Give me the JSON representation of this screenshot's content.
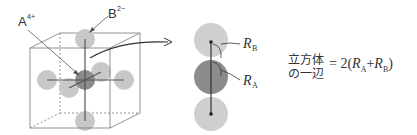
{
  "labels": {
    "cation": "A",
    "cation_charge": "4+",
    "anion": "B",
    "anion_charge": "2−",
    "radius_b": "R",
    "radius_b_sub": "B",
    "radius_a": "R",
    "radius_a_sub": "A"
  },
  "formula": {
    "line1": "立方体",
    "line2": "の一辺",
    "equals": "= 2(",
    "ra": "R",
    "ra_sub": "A",
    "plus": "+",
    "rb": "R",
    "rb_sub": "B",
    "close": ")"
  },
  "colors": {
    "anion": "#c8c8c8",
    "cation": "#8c8c8c",
    "line": "#555555",
    "cube": "#666666"
  }
}
